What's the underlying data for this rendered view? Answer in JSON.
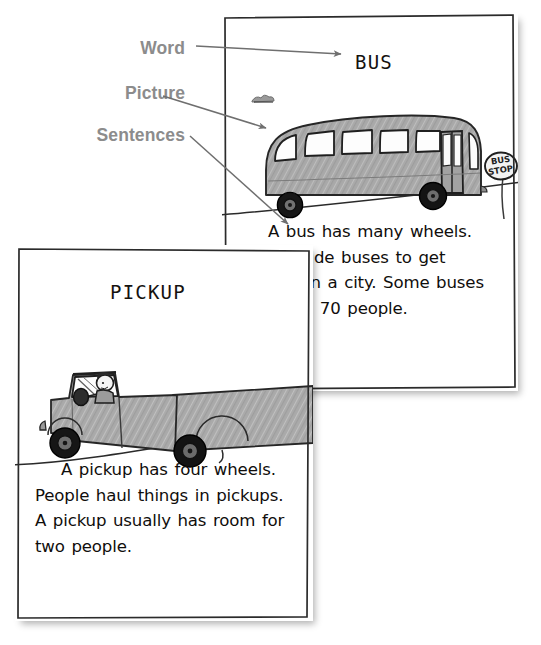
{
  "callouts": {
    "color": "#8c8c8c",
    "items": [
      {
        "label": "Word"
      },
      {
        "label": "Picture"
      },
      {
        "label": "Sentences"
      }
    ]
  },
  "cards": {
    "bus": {
      "title": "BUS",
      "sign_line1": "BUS",
      "sign_line2": "STOP",
      "text": "A bus has many wheels. People ride buses to get around in a city. Some buses can hold 70 people."
    },
    "pickup": {
      "title": "PICKUP",
      "text": "A pickup has four wheels. People haul things in pickups. A pickup usually has room for two people."
    }
  },
  "palette": {
    "page_background": "#ffffff",
    "card_background": "#ffffff",
    "ink": "#100e0c",
    "label_gray": "#8c8c8c",
    "vehicle_body": "#a8a8a8",
    "vehicle_body_light": "#b8b8b8",
    "window_white": "#fdfdfd",
    "wheel_dark": "#1a1a1a",
    "leader_line": "#6f6f6f"
  }
}
